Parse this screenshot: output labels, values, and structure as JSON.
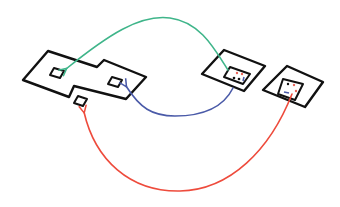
{
  "diagram": {
    "colors": {
      "outline": "#111111",
      "green_arrow": "#3fb58a",
      "blue_arrow": "#4a5aa8",
      "red_arrow": "#ee4b3c",
      "dot_red": "#e8655a",
      "dot_black": "#111111",
      "dot_blue": "#4a5aa8"
    },
    "nodes": [
      {
        "id": "large-component",
        "shape": "stepped-polygon",
        "ports": 3
      },
      {
        "id": "middle-component",
        "shape": "nested-squares",
        "inner_dots": [
          "red",
          "red",
          "black",
          "black",
          "blue"
        ]
      },
      {
        "id": "right-component",
        "shape": "nested-squares",
        "inner_dots": [
          "black",
          "red",
          "blue",
          "red"
        ]
      }
    ],
    "edges": [
      {
        "color": "green",
        "from": "middle-component",
        "to": "large-component.port-left"
      },
      {
        "color": "blue",
        "from": "middle-component",
        "to": "large-component.port-right"
      },
      {
        "color": "red",
        "from": "right-component",
        "to": "large-component.port-bottom"
      }
    ]
  }
}
